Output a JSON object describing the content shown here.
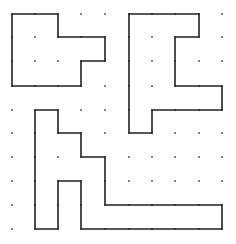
{
  "diagram": {
    "type": "dot-grid-polyominoes",
    "grid": {
      "cols_x": [
        12,
        35,
        58,
        81,
        105,
        129,
        152,
        175,
        199,
        222
      ],
      "rows_y": [
        14,
        37,
        61,
        86,
        110,
        133,
        157,
        181,
        205,
        229
      ],
      "dot_color": "#555555"
    },
    "line_color": "#222222",
    "shapes": [
      {
        "name": "top-left-shape",
        "grid_points": [
          [
            0,
            0
          ],
          [
            2,
            0
          ],
          [
            2,
            1
          ],
          [
            4,
            1
          ],
          [
            4,
            2
          ],
          [
            3,
            2
          ],
          [
            3,
            3
          ],
          [
            0,
            3
          ]
        ]
      },
      {
        "name": "top-right-shape",
        "grid_points": [
          [
            5,
            0
          ],
          [
            8,
            0
          ],
          [
            8,
            1
          ],
          [
            7,
            1
          ],
          [
            7,
            3
          ],
          [
            9,
            3
          ],
          [
            9,
            4
          ],
          [
            6,
            4
          ],
          [
            6,
            5
          ],
          [
            5,
            5
          ]
        ]
      },
      {
        "name": "bottom-shape",
        "grid_points": [
          [
            1,
            4
          ],
          [
            2,
            4
          ],
          [
            2,
            5
          ],
          [
            3,
            5
          ],
          [
            3,
            6
          ],
          [
            4,
            6
          ],
          [
            4,
            8
          ],
          [
            9,
            8
          ],
          [
            9,
            9
          ],
          [
            3,
            9
          ],
          [
            3,
            7
          ],
          [
            2,
            7
          ],
          [
            2,
            9
          ],
          [
            1,
            9
          ]
        ]
      }
    ]
  }
}
